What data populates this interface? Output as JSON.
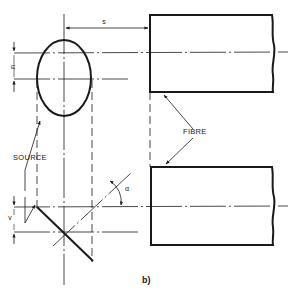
{
  "diagram": {
    "caption": "b)",
    "labels": {
      "s": "s",
      "u": "u",
      "v": "v",
      "alpha": "α",
      "source": "SOURCE",
      "fibre": "FIBRE"
    },
    "colors": {
      "ink": "#1a1a1a",
      "background": "#ffffff"
    }
  }
}
